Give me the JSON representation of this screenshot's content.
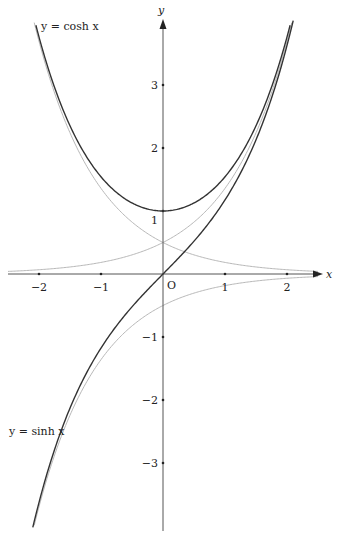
{
  "chart_data": {
    "type": "line",
    "title": "",
    "xlabel": "x",
    "ylabel": "y",
    "origin_label": "O",
    "xlim": [
      -2.1,
      2.1
    ],
    "ylim": [
      -4.0,
      3.9
    ],
    "grid": false,
    "x_ticks": [
      -2,
      -1,
      1,
      2
    ],
    "x_tick_labels": [
      "−2",
      "−1",
      "1",
      "2"
    ],
    "y_ticks": [
      3,
      2,
      1,
      -1,
      -2,
      -3
    ],
    "y_tick_labels": [
      "3",
      "2",
      "1",
      "−1",
      "−2",
      "−3"
    ],
    "series": [
      {
        "name": "y = cosh x",
        "label": "y = cosh x",
        "function": "cosh",
        "color": "#333333",
        "width": 1.4,
        "x": [
          -2.05,
          -1.5,
          -1,
          -0.5,
          0,
          0.5,
          1,
          1.5,
          2.05
        ],
        "values": [
          3.95,
          2.35,
          1.54,
          1.13,
          1.0,
          1.13,
          1.54,
          2.35,
          3.95
        ]
      },
      {
        "name": "y = sinh x",
        "label": "y = sinh x",
        "function": "sinh",
        "color": "#333333",
        "width": 1.4,
        "x": [
          -2.1,
          -1.5,
          -1,
          -0.5,
          0,
          0.5,
          1,
          1.5,
          2.1
        ],
        "values": [
          -4.02,
          -2.13,
          -1.18,
          -0.52,
          0,
          0.52,
          1.18,
          2.13,
          4.02
        ]
      },
      {
        "name": "y = e^x / 2",
        "function": "halfexp",
        "color": "#b8b8b8",
        "width": 1,
        "x": [
          -2.5,
          -1,
          0,
          1,
          2.1
        ],
        "values": [
          0.04,
          0.18,
          0.5,
          1.36,
          4.08
        ]
      },
      {
        "name": "y = e^-x / 2",
        "function": "halfexpneg",
        "color": "#b8b8b8",
        "width": 1,
        "x": [
          -2.1,
          -1,
          0,
          1,
          2.5
        ],
        "values": [
          4.08,
          1.36,
          0.5,
          0.18,
          0.04
        ]
      },
      {
        "name": "y = -e^-x / 2",
        "function": "neghalfexpneg",
        "color": "#b8b8b8",
        "width": 1,
        "x": [
          -2.1,
          -1,
          0,
          1,
          2.5
        ],
        "values": [
          -4.08,
          -1.36,
          -0.5,
          -0.18,
          -0.04
        ]
      }
    ],
    "annotations": [
      {
        "text": "y = cosh x",
        "near": "upper-left"
      },
      {
        "text": "y = sinh x",
        "near": "lower-left"
      }
    ]
  },
  "labels": {
    "cosh": "y = cosh x",
    "sinh": "y = sinh x",
    "x_axis": "x",
    "y_axis": "y",
    "origin": "O"
  }
}
